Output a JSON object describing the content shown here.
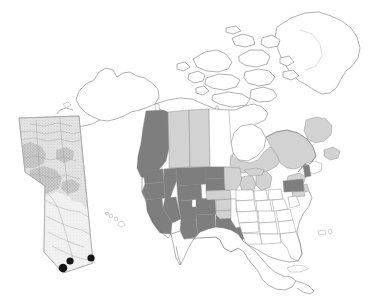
{
  "figure": {
    "background_color": "#ffffff",
    "width": 372,
    "height": 305
  },
  "legend_colors": {
    "highlight_dark": "#7e7e7e",
    "highlight_light": "#d2d2d2",
    "unshaded": "#ffffff",
    "outline": "#6f6f6f",
    "marker": "#151515"
  },
  "main_map": {
    "name": "north-america",
    "projection_note": "conic, continental extent",
    "regions_dark": [
      "British Columbia",
      "Washington",
      "Oregon",
      "Idaho",
      "Montana",
      "Wyoming",
      "Nevada",
      "Utah",
      "Colorado",
      "California",
      "Arizona",
      "New Mexico",
      "North Dakota",
      "South Dakota",
      "Texas",
      "Pennsylvania",
      "Vermont"
    ],
    "regions_light": [
      "Alberta",
      "Saskatchewan",
      "Ontario",
      "Quebec",
      "Newfoundland and Labrador",
      "Nebraska",
      "Kansas",
      "Oklahoma",
      "Minnesota",
      "Wisconsin",
      "Michigan",
      "New York",
      "New Jersey",
      "Maryland"
    ],
    "regions_unshaded": [
      "Alaska",
      "Yukon",
      "Northwest Territories",
      "Nunavut",
      "Manitoba",
      "Greenland",
      "Mexico",
      "Central America",
      "Cuba",
      "Hawaii",
      "Eastern United States"
    ]
  },
  "inset_map": {
    "name": "alberta-inset",
    "label": "Alberta",
    "shading": "stippled elevation / landcover texture",
    "marker_count": 3,
    "markers": [
      {
        "id": "site-1",
        "placement": "southwest corner"
      },
      {
        "id": "site-2",
        "placement": "south-central"
      },
      {
        "id": "site-3",
        "placement": "southeast corner"
      }
    ]
  }
}
